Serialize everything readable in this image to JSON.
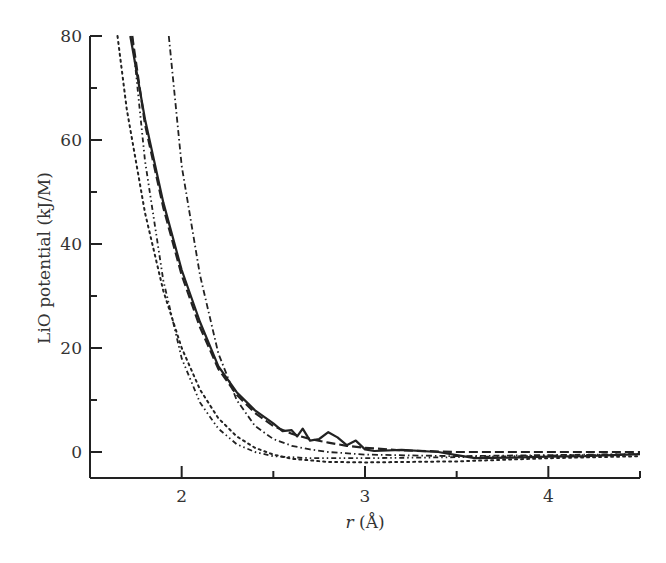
{
  "chart_data": {
    "type": "line",
    "title": "",
    "xlabel_italic": "r",
    "xlabel_unit": " (Å)",
    "xlabel": "r (Å)",
    "ylabel": "LiO potential (kJ/M)",
    "xlim": [
      1.5,
      4.5
    ],
    "ylim": [
      -5,
      80
    ],
    "grid": false,
    "legend": "none",
    "x_ticks": [
      2,
      3,
      4
    ],
    "x_minor_ticks": [
      2.5,
      3.5,
      4.5
    ],
    "y_ticks": [
      0,
      20,
      40,
      60,
      80
    ],
    "y_minor_ticks": [
      10,
      30,
      50,
      70
    ],
    "series": [
      {
        "name": "solid",
        "style": "solid",
        "points": [
          [
            1.72,
            80
          ],
          [
            1.8,
            64
          ],
          [
            1.9,
            48
          ],
          [
            2.0,
            35
          ],
          [
            2.1,
            25
          ],
          [
            2.2,
            16.5
          ],
          [
            2.3,
            11.5
          ],
          [
            2.4,
            8
          ],
          [
            2.5,
            5.5
          ],
          [
            2.55,
            4
          ],
          [
            2.6,
            4.2
          ],
          [
            2.63,
            3
          ],
          [
            2.66,
            4.5
          ],
          [
            2.7,
            2.2
          ],
          [
            2.75,
            2.5
          ],
          [
            2.8,
            3.8
          ],
          [
            2.85,
            2.8
          ],
          [
            2.9,
            1.3
          ],
          [
            2.95,
            2.2
          ],
          [
            3.0,
            0.5
          ],
          [
            3.05,
            0.2
          ],
          [
            3.2,
            0.4
          ],
          [
            3.4,
            0
          ],
          [
            3.5,
            -0.6
          ],
          [
            3.6,
            -1.2
          ],
          [
            3.8,
            -1.1
          ],
          [
            4.0,
            -0.9
          ],
          [
            4.2,
            -0.8
          ],
          [
            4.5,
            -0.4
          ]
        ]
      },
      {
        "name": "dashed",
        "style": "dashed",
        "points": [
          [
            1.73,
            80
          ],
          [
            1.8,
            63
          ],
          [
            1.9,
            47
          ],
          [
            2.0,
            34
          ],
          [
            2.1,
            24
          ],
          [
            2.2,
            16
          ],
          [
            2.3,
            11
          ],
          [
            2.4,
            7.5
          ],
          [
            2.5,
            5
          ],
          [
            2.6,
            3.5
          ],
          [
            2.7,
            2.5
          ],
          [
            2.8,
            1.8
          ],
          [
            2.9,
            1.2
          ],
          [
            3.0,
            0.8
          ],
          [
            3.2,
            0.3
          ],
          [
            3.5,
            0
          ],
          [
            4.0,
            0
          ],
          [
            4.5,
            0
          ]
        ]
      },
      {
        "name": "dash-dot-right",
        "style": "dashdot",
        "points": [
          [
            1.93,
            80
          ],
          [
            2.0,
            55
          ],
          [
            2.1,
            34
          ],
          [
            2.2,
            19
          ],
          [
            2.3,
            10
          ],
          [
            2.4,
            5
          ],
          [
            2.5,
            2.5
          ],
          [
            2.6,
            1.2
          ],
          [
            2.7,
            0.5
          ],
          [
            2.8,
            0
          ],
          [
            3.0,
            -0.5
          ],
          [
            3.5,
            -0.8
          ],
          [
            4.0,
            -0.6
          ],
          [
            4.5,
            -0.4
          ]
        ]
      },
      {
        "name": "dash-dot-left",
        "style": "dashdotdot",
        "points": [
          [
            1.73,
            80
          ],
          [
            1.8,
            56
          ],
          [
            1.9,
            33
          ],
          [
            2.0,
            18
          ],
          [
            2.1,
            9.5
          ],
          [
            2.2,
            4.5
          ],
          [
            2.3,
            1.5
          ],
          [
            2.4,
            0
          ],
          [
            2.5,
            -0.8
          ],
          [
            2.7,
            -1.2
          ],
          [
            3.0,
            -1.2
          ],
          [
            3.5,
            -1
          ],
          [
            4.0,
            -0.7
          ],
          [
            4.5,
            -0.4
          ]
        ]
      },
      {
        "name": "dotted",
        "style": "dotted",
        "points": [
          [
            1.65,
            80
          ],
          [
            1.7,
            66
          ],
          [
            1.8,
            46
          ],
          [
            1.9,
            31
          ],
          [
            2.0,
            20
          ],
          [
            2.1,
            12
          ],
          [
            2.2,
            6.5
          ],
          [
            2.3,
            3
          ],
          [
            2.4,
            0.8
          ],
          [
            2.5,
            -0.5
          ],
          [
            2.6,
            -1.3
          ],
          [
            2.8,
            -1.9
          ],
          [
            3.0,
            -2.0
          ],
          [
            3.5,
            -1.8
          ],
          [
            4.0,
            -1.2
          ],
          [
            4.5,
            -0.8
          ]
        ]
      }
    ]
  },
  "colors": {
    "ink": "#222222",
    "background": "#ffffff"
  }
}
